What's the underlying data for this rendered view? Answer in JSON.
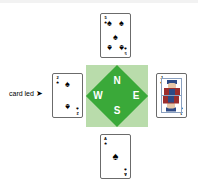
{
  "diagram": {
    "annotation": {
      "text": "card led",
      "arrow_glyph": "➤"
    },
    "compass": {
      "north_label": "N",
      "west_label": "W",
      "east_label": "E",
      "south_label": "S",
      "diamond_color": "#3aa939",
      "square_color": "#b9dcab",
      "label_color": "#ffffff"
    },
    "cards": {
      "north": {
        "position": "North",
        "rank": "5",
        "suit_name": "spades",
        "suit_glyph": "♠",
        "type": "pip",
        "pip_count": "5"
      },
      "west": {
        "position": "West",
        "rank": "2",
        "suit_name": "spades",
        "suit_glyph": "♠",
        "type": "pip",
        "pip_count": "2"
      },
      "east": {
        "position": "East",
        "rank": "J",
        "suit_name": "spades",
        "suit_glyph": "♠",
        "type": "court",
        "pip_count": "0"
      },
      "south": {
        "position": "South",
        "rank": "A",
        "suit_name": "spades",
        "suit_glyph": "♠",
        "type": "pip",
        "pip_count": "1"
      }
    }
  }
}
